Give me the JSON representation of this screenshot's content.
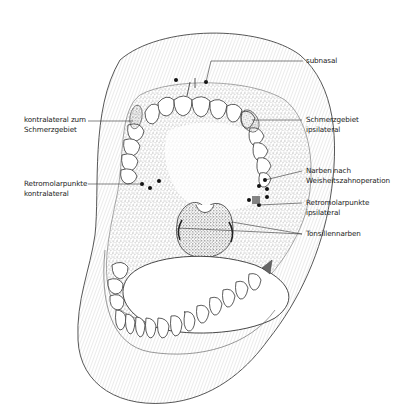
{
  "figure": {
    "type": "anatomical-illustration",
    "colors": {
      "line": "#333333",
      "stipple": "#555555",
      "shaded": "#7a7a7a",
      "background": "#ffffff"
    }
  },
  "labels": {
    "subnasal": "subnasal",
    "kontralateral_line1": "kontralateral zum",
    "kontralateral_line2": "Schmerzgebiet",
    "schmerz_line1": "Schmerzgebiet",
    "schmerz_line2": "ipsilateral",
    "narben_line1": "Narben nach",
    "narben_line2": "Weisheitszahnoperation",
    "retro_kontra_line1": "Retromolarpunkte",
    "retro_kontra_line2": "kontralateral",
    "retro_ipsi_line1": "Retromolarpunkte",
    "retro_ipsi_line2": "ipsilateral",
    "tonsillen": "Tonsillennarben"
  }
}
